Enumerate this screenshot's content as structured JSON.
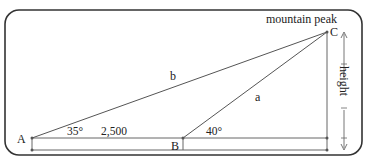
{
  "diagram": {
    "title_label": "mountain peak",
    "points": {
      "A": "A",
      "B": "B",
      "C": "C"
    },
    "sides": {
      "a": "a",
      "b": "b"
    },
    "angle_A": "35°",
    "angle_B": "40°",
    "distance_AB": "2,500",
    "height_label": "height",
    "colors": {
      "line": "#555555",
      "frame": "#333333",
      "text": "#222222"
    }
  }
}
